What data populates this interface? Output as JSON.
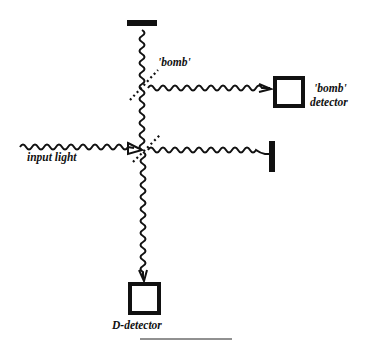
{
  "diagram": {
    "type": "interferometer-schematic",
    "labels": {
      "bomb": "'bomb'",
      "bomb_detector_line1": "'bomb'",
      "bomb_detector_line2": "detector",
      "input_light": "input light",
      "d_detector": "D-detector"
    },
    "components": [
      {
        "id": "top-mirror",
        "kind": "mirror"
      },
      {
        "id": "right-mirror",
        "kind": "mirror"
      },
      {
        "id": "upper-beamsplitter",
        "kind": "beamsplitter",
        "label": "'bomb'"
      },
      {
        "id": "lower-beamsplitter",
        "kind": "beamsplitter"
      },
      {
        "id": "bomb-detector",
        "kind": "detector",
        "label": "'bomb' detector"
      },
      {
        "id": "d-detector",
        "kind": "detector",
        "label": "D-detector"
      },
      {
        "id": "input-light",
        "kind": "light-source",
        "label": "input light"
      }
    ],
    "colors": {
      "ink": "#111111",
      "background": "#ffffff"
    }
  }
}
